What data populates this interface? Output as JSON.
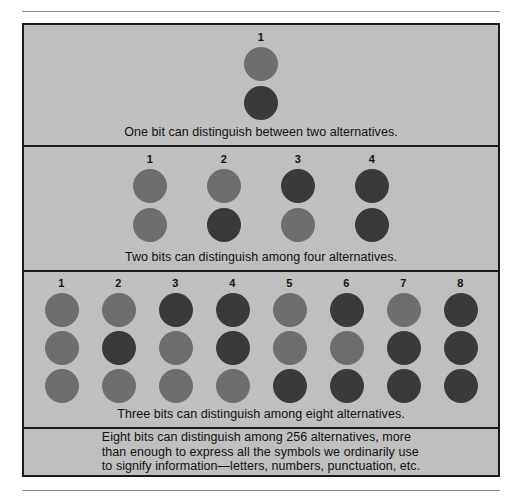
{
  "figure": {
    "background_color": "#bfbfbf",
    "border_color": "#1a1a1a",
    "light_dot_color": "#6e6e6e",
    "dark_dot_color": "#3a3a3a",
    "panels": [
      {
        "id": "one-bit",
        "bits": 1,
        "column_labels": [
          "1"
        ],
        "rows": 2,
        "columns": [
          {
            "label": "1",
            "dots": [
              "light",
              "dark"
            ]
          }
        ],
        "caption": "One bit can distinguish between two alternatives."
      },
      {
        "id": "two-bit",
        "bits": 2,
        "column_labels": [
          "1",
          "2",
          "3",
          "4"
        ],
        "rows": 2,
        "columns": [
          {
            "label": "1",
            "dots": [
              "light",
              "light"
            ]
          },
          {
            "label": "2",
            "dots": [
              "light",
              "dark"
            ]
          },
          {
            "label": "3",
            "dots": [
              "dark",
              "light"
            ]
          },
          {
            "label": "4",
            "dots": [
              "dark",
              "dark"
            ]
          }
        ],
        "caption": "Two bits can distinguish among four alternatives."
      },
      {
        "id": "three-bit",
        "bits": 3,
        "column_labels": [
          "1",
          "2",
          "3",
          "4",
          "5",
          "6",
          "7",
          "8"
        ],
        "rows": 3,
        "columns": [
          {
            "label": "1",
            "dots": [
              "light",
              "light",
              "light"
            ]
          },
          {
            "label": "2",
            "dots": [
              "light",
              "dark",
              "light"
            ]
          },
          {
            "label": "3",
            "dots": [
              "dark",
              "light",
              "light"
            ]
          },
          {
            "label": "4",
            "dots": [
              "dark",
              "dark",
              "light"
            ]
          },
          {
            "label": "5",
            "dots": [
              "light",
              "light",
              "dark"
            ]
          },
          {
            "label": "6",
            "dots": [
              "dark",
              "light",
              "dark"
            ]
          },
          {
            "label": "7",
            "dots": [
              "light",
              "dark",
              "dark"
            ]
          },
          {
            "label": "8",
            "dots": [
              "dark",
              "dark",
              "dark"
            ]
          }
        ],
        "caption": "Three bits can distinguish among eight alternatives."
      }
    ],
    "note": {
      "lines": [
        "Eight bits can distinguish among 256 alternatives, more",
        "than enough to express all the symbols we ordinarily use",
        "to signify information—letters, numbers, punctuation, etc."
      ]
    }
  }
}
